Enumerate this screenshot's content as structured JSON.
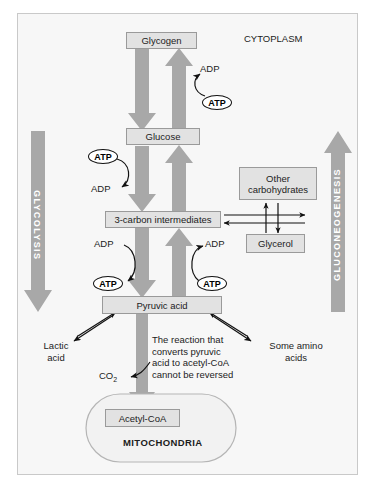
{
  "diagram": {
    "compartments": {
      "cytoplasm_label": "CYTOPLASM",
      "mitochondria_label": "MITOCHONDRIA"
    },
    "pathway_arrows": [
      {
        "name": "glycolysis",
        "label": "GLYCOLYSIS",
        "direction": "down",
        "color": "#a0a0a0"
      },
      {
        "name": "gluconeogenesis",
        "label": "GLUCONEOGENESIS",
        "direction": "up",
        "color": "#a0a0a0"
      }
    ],
    "metabolites": [
      {
        "name": "glycogen",
        "label": "Glycogen"
      },
      {
        "name": "glucose",
        "label": "Glucose"
      },
      {
        "name": "three-carbon-intermediates",
        "label": "3-carbon intermediates"
      },
      {
        "name": "pyruvic-acid",
        "label": "Pyruvic acid"
      },
      {
        "name": "other-carbohydrates",
        "label": "Other\ncarbohydrates"
      },
      {
        "name": "glycerol",
        "label": "Glycerol"
      },
      {
        "name": "acetyl-coa",
        "label": "Acetyl-CoA"
      }
    ],
    "energy_carriers": {
      "atp": "ATP",
      "adp": "ADP"
    },
    "side_labels": [
      {
        "name": "lactic-acid",
        "label": "Lactic\nacid"
      },
      {
        "name": "some-amino-acids",
        "label": "Some amino\nacids"
      }
    ],
    "co2": {
      "text": "CO",
      "subscript": "2"
    },
    "annotation": "The reaction that\nconverts pyruvic\nacid to acetyl-CoA\ncannot be reversed",
    "colors": {
      "arrow_gray": "#a8a8a8",
      "box_fill": "#e2e2e2",
      "box_stroke": "#9a9a9a",
      "panel_bg": "#f7f7f7",
      "panel_border": "#c9c9c9",
      "text": "#1c1c1c",
      "white": "#ffffff"
    }
  }
}
